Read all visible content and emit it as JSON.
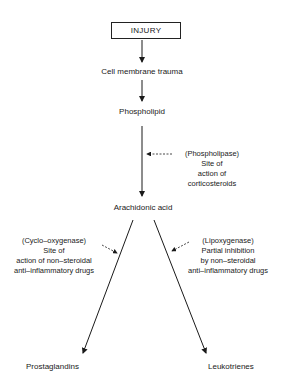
{
  "diagram": {
    "root": "INJURY",
    "steps": [
      "Cell membrane trauma",
      "Phospholipid",
      "Arachidonic acid"
    ],
    "outputs": {
      "left": "Prostaglandins",
      "right": "Leukotrienes"
    },
    "annotations": {
      "phospholipase": [
        "(Phospholipase)",
        "Site of",
        "action of",
        "corticosteroids"
      ],
      "cyclooxygenase": [
        "(Cyclo–oxygenase)",
        "Site of",
        "action of non–steroidal",
        "anti–inflammatory drugs"
      ],
      "lipoxygenase": [
        "(Lipoxygenase)",
        "Partial inhibition",
        "by non–steroidal",
        "anti–inflammatory drugs"
      ]
    }
  }
}
